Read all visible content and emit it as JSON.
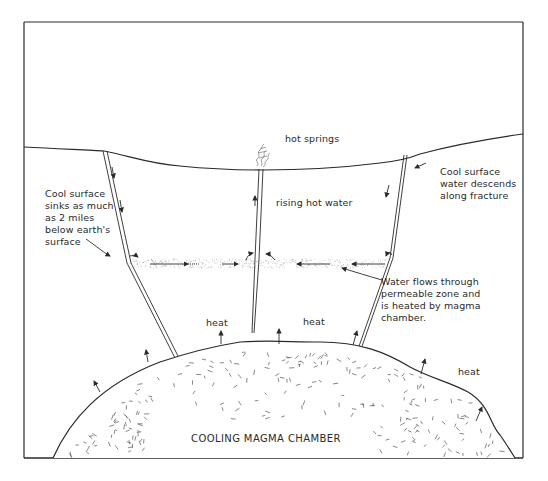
{
  "diagram": {
    "type": "cross-section",
    "colors": {
      "ink": "#2a2a2a",
      "background": "#ffffff",
      "stipple": "#9a9a9a"
    },
    "labels": {
      "hot_springs": "hot springs",
      "rising_hot_water": "rising hot water",
      "cool_surface_left": "Cool surface\nsinks as much\nas 2 miles\nbelow earth's\nsurface",
      "cool_surface_right": "Cool surface\nwater descends\nalong fracture",
      "water_flows": "Water flows through\npermeable zone and\nis heated by magma\nchamber.",
      "heat_1": "heat",
      "heat_2": "heat",
      "heat_3": "heat",
      "magma_chamber": "COOLING MAGMA CHAMBER"
    },
    "features": [
      "ground-surface",
      "left-fracture",
      "central-vent",
      "right-fracture",
      "permeable-zone",
      "magma-chamber",
      "heat-arrows",
      "steam-plume"
    ]
  }
}
